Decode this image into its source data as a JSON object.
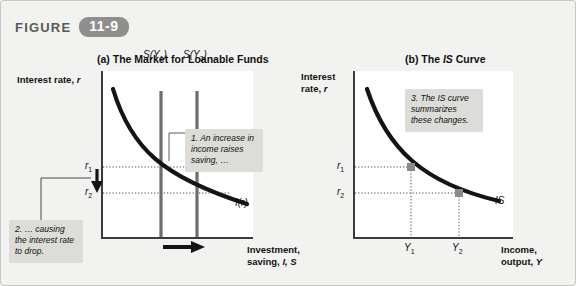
{
  "header": {
    "word": "FIGURE",
    "number": "11-9",
    "badge_color": "#8e8e8c"
  },
  "panels": [
    {
      "id": "a",
      "title_prefix": "(a) The Market for Loanable Funds",
      "y_axis_label": "Interest rate, r",
      "x_axis_label": "Investment,\nsaving, I, S",
      "y_ticks": [
        "r₁",
        "r₂"
      ],
      "x_ticks": [],
      "curves": [
        {
          "name": "investment-curve",
          "label": "I(r)"
        },
        {
          "name": "saving-curve-1",
          "label": "S(Y₁)"
        },
        {
          "name": "saving-curve-2",
          "label": "S(Y₂)"
        }
      ]
    },
    {
      "id": "b",
      "title_prefix": "(b) The IS Curve",
      "y_axis_label": "Interest\nrate, r",
      "x_axis_label": "Income,\noutput, Y",
      "y_ticks": [
        "r₁",
        "r₂"
      ],
      "x_ticks": [
        "Y₁",
        "Y₂"
      ],
      "curves": [
        {
          "name": "is-curve",
          "label": "IS"
        }
      ]
    }
  ],
  "callouts": [
    {
      "id": "1",
      "text": "1. An increase in income raises saving, …"
    },
    {
      "id": "2",
      "text": "2. … causing the interest rate to drop."
    },
    {
      "id": "3",
      "text": "3. The IS curve summarizes these changes."
    }
  ],
  "labels": {
    "title_a_plain": "(a) The Market for Loanable Funds",
    "title_b_pre": "(b) The ",
    "title_b_italic": "IS",
    "title_b_post": " Curve",
    "ylab_a_pre": "Interest rate, ",
    "ylab_a_italic": "r",
    "ylab_b_line1": "Interest",
    "ylab_b_line2_pre": "rate, ",
    "ylab_b_line2_italic": "r",
    "xlab_a_line1": "Investment,",
    "xlab_a_line2_pre": "saving, ",
    "xlab_a_line2_italic": "I, S",
    "xlab_b_line1": "Income,",
    "xlab_b_line2_pre": "output, ",
    "xlab_b_line2_italic": "Y",
    "r1": "r",
    "r1_sub": "1",
    "r2": "r",
    "r2_sub": "2",
    "y1": "Y",
    "y1_sub": "1",
    "y2": "Y",
    "y2_sub": "2",
    "s_y1": "S(Y",
    "s_y1_sub": "1",
    "s_y1_close": ")",
    "s_y2": "S(Y",
    "s_y2_sub": "2",
    "s_y2_close": ")",
    "i_r": "I(r)",
    "is": "IS"
  },
  "colors": {
    "background": "#f2f2f0",
    "panel": "#ffffff",
    "curve": "#1a1a1a",
    "callout_bg": "#dcdcd8",
    "axis": "#3c3c3c"
  }
}
